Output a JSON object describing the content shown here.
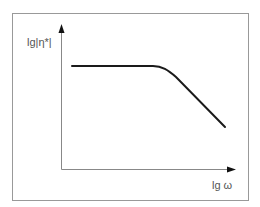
{
  "diagram": {
    "type": "viscosity-frequency schematic",
    "y_axis_label": "lg|η*|",
    "x_axis_label": "lg ω",
    "curve": {
      "description": "Newtonian plateau followed by shear-thinning decline",
      "plateau_level": "constant",
      "behavior_high_freq": "decreasing linearly (log-log)"
    },
    "colors": {
      "frame": "#999999",
      "axes": "#888888",
      "arrowheads": "#111111",
      "curve": "#1a1a1a",
      "labels": "#555555"
    }
  }
}
